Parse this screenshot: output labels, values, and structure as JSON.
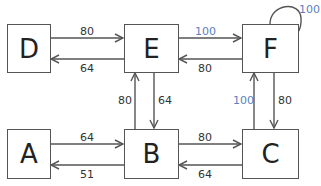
{
  "nodes": {
    "D": "D",
    "E": "E",
    "F": "F",
    "A": "A",
    "B": "B",
    "C": "C"
  },
  "edges": {
    "D_to_E": "80",
    "E_to_D": "64",
    "E_to_F": "100",
    "F_to_E": "80",
    "F_to_F": "100",
    "B_to_E": "80",
    "E_to_B": "64",
    "C_to_F": "100",
    "F_to_C": "80",
    "A_to_B": "64",
    "B_to_A": "51",
    "B_to_C": "80",
    "C_to_B": "64"
  },
  "colors": {
    "highlight": "#5b7fbf",
    "line": "#555555"
  }
}
